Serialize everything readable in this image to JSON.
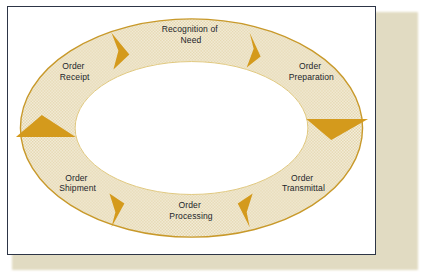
{
  "diagram": {
    "type": "cycle",
    "direction": "clockwise",
    "frame": {
      "border_color": "#2d3546",
      "background_color": "#ffffff",
      "shadow_color": "#d8cfae"
    },
    "ring": {
      "fill_texture": "dotted",
      "fill_color": "#f4eedd",
      "dot_color": "#d9c89a",
      "outline_color": "#c8992a",
      "inner_fill_color": "#ffffff"
    },
    "arrow": {
      "color": "#d49a1c",
      "count": 6,
      "name": "flow-arrow"
    },
    "stages": [
      {
        "id": "recognition-of-need",
        "line1": "Recognition of",
        "line2": "Need"
      },
      {
        "id": "order-preparation",
        "line1": "Order",
        "line2": "Preparation"
      },
      {
        "id": "order-transmittal",
        "line1": "Order",
        "line2": "Transmittal"
      },
      {
        "id": "order-processing",
        "line1": "Order",
        "line2": "Processing"
      },
      {
        "id": "order-shipment",
        "line1": "Order",
        "line2": "Shipment"
      },
      {
        "id": "order-receipt",
        "line1": "Order",
        "line2": "Receipt"
      }
    ]
  }
}
